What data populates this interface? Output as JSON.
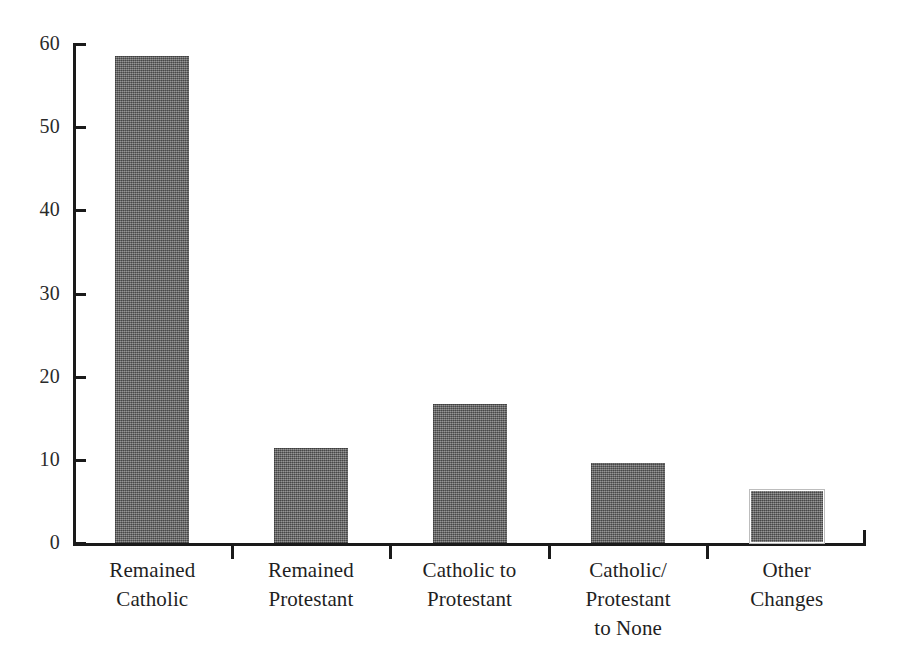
{
  "chart_data": {
    "type": "bar",
    "title": "",
    "subtitle": "",
    "xlabel": "",
    "ylabel": "",
    "categories": [
      "Remained\nCatholic",
      "Remained\nProtestant",
      "Catholic to\nProtestant",
      "Catholic/\nProtestant\nto None",
      "Other\nChanges"
    ],
    "values": [
      58.5,
      11.4,
      16.7,
      9.6,
      6.4
    ],
    "ylim": [
      0,
      60
    ],
    "yticks": [
      0,
      10,
      20,
      30,
      40,
      50,
      60
    ],
    "ytick_labels": [
      "0",
      "10",
      "20",
      "30",
      "40",
      "50",
      "60"
    ],
    "grid": false,
    "legend": false,
    "bar_color": "#6c6c6c",
    "axis_color": "#1a1a1a",
    "background_color": "#ffffff"
  },
  "axis": {
    "y_labels": [
      "60",
      "50",
      "40",
      "30",
      "20",
      "10",
      "0"
    ]
  }
}
